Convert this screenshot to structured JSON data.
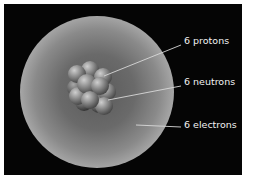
{
  "diagram": {
    "labels": [
      {
        "text": "6 protons",
        "target": "nucleus-proton"
      },
      {
        "text": "6 neutrons",
        "target": "nucleus-neutron"
      },
      {
        "text": "6 electrons",
        "target": "electron-cloud"
      }
    ],
    "colors": {
      "background": "#050505",
      "frame": "#ffffff",
      "label_text": "#f2f2f2",
      "leader_line": "#d8d8d8",
      "cloud_mid": "#a8a8a8",
      "nucleus_particle": "#8c8c8c"
    }
  }
}
